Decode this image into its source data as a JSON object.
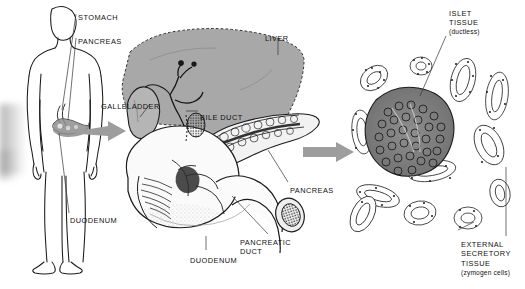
{
  "figure": {
    "background_color": "#ffffff",
    "ink_color": "#111111",
    "organ_fill_color": "#a8a8a8",
    "arrow_color": "#a0a0a0",
    "width": 525,
    "height": 289
  },
  "panels": {
    "left": {
      "name": "human-body-outline",
      "labels": [
        {
          "key": "stomach",
          "text": "STOMACH",
          "x": 78,
          "y": 13
        },
        {
          "key": "pancreas",
          "text": "PANCREAS",
          "x": 78,
          "y": 37
        },
        {
          "key": "duodenum",
          "text": "DUODENUM",
          "x": 70,
          "y": 216
        }
      ]
    },
    "middle": {
      "name": "gross-anatomy-liver-pancreas-duodenum",
      "labels": [
        {
          "key": "liver",
          "text": "LIVER",
          "x": 265,
          "y": 34
        },
        {
          "key": "gallbladder",
          "text": "GALLBLADDER",
          "x": 101,
          "y": 102
        },
        {
          "key": "bile_duct",
          "text": "BILE DUCT",
          "x": 200,
          "y": 113
        },
        {
          "key": "pancreas",
          "text": "PANCREAS",
          "x": 290,
          "y": 186
        },
        {
          "key": "pancreatic_duct",
          "text": "PANCREATIC\nDUCT",
          "x": 240,
          "y": 238
        },
        {
          "key": "duodenum",
          "text": "DUODENUM",
          "x": 190,
          "y": 256
        }
      ]
    },
    "right": {
      "name": "histology-microscopic-section",
      "labels": [
        {
          "key": "islet_tissue",
          "text": "ISLET\nTISSUE",
          "x": 449,
          "y": 9
        },
        {
          "key": "islet_sub",
          "text": "(ductless)",
          "x": 449,
          "y": 27
        },
        {
          "key": "external_tissue",
          "text": "EXTERNAL\nSECRETORY\nTISSUE",
          "x": 461,
          "y": 240
        },
        {
          "key": "external_sub",
          "text": "(zymogen cells)",
          "x": 461,
          "y": 268
        }
      ]
    }
  },
  "arrows": [
    {
      "name": "arrow-body-to-gross",
      "x": 86,
      "y": 140
    },
    {
      "name": "arrow-gross-to-histology",
      "x": 303,
      "y": 152
    }
  ]
}
